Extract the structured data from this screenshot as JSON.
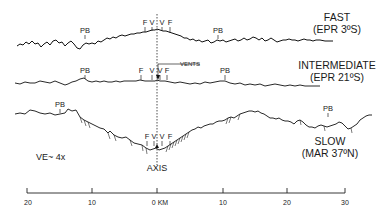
{
  "diagram": {
    "type": "bathymetric-profiles",
    "vertical_exaggeration": "VE~ 4x",
    "axis_label": "AXIS",
    "vents_label": "VENTS",
    "profiles": [
      {
        "id": "fast",
        "title": "FAST",
        "subtitle": "(EPR 3ºS)",
        "markers": [
          {
            "label": "PB",
            "x": 85
          },
          {
            "label": "F",
            "x": 145
          },
          {
            "label": "V",
            "x": 152
          },
          {
            "label": "V",
            "x": 162
          },
          {
            "label": "F",
            "x": 170
          },
          {
            "label": "PB",
            "x": 218
          }
        ]
      },
      {
        "id": "intermediate",
        "title": "INTERMEDIATE",
        "subtitle": "(EPR 21ºS)",
        "markers": [
          {
            "label": "PB",
            "x": 85
          },
          {
            "label": "F",
            "x": 141
          },
          {
            "label": "V",
            "x": 152
          },
          {
            "label": "V",
            "x": 160
          },
          {
            "label": "F",
            "x": 167
          },
          {
            "label": "PB",
            "x": 225
          }
        ]
      },
      {
        "id": "slow",
        "title": "SLOW",
        "subtitle": "(MAR 37ºN)",
        "markers": [
          {
            "label": "PB",
            "x": 60
          },
          {
            "label": "F",
            "x": 147
          },
          {
            "label": "V",
            "x": 154
          },
          {
            "label": "V",
            "x": 162
          },
          {
            "label": "F",
            "x": 170
          },
          {
            "label": "PB",
            "x": 328
          }
        ]
      }
    ],
    "scale_bar": {
      "ticks": [
        "20",
        "10",
        "0 KM",
        "10",
        "20",
        "30"
      ],
      "unit": "KM"
    }
  }
}
